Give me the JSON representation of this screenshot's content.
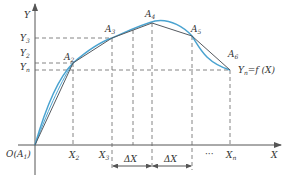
{
  "diagram": {
    "colors": {
      "curve": "#4aa3d0",
      "polyline": "#555a60",
      "axis": "#555555",
      "dashed": "#666666"
    },
    "axes": {
      "x_label": "X",
      "y_label": "Y",
      "origin_label": "O(A",
      "origin_sub": "1",
      "origin_close": ")"
    },
    "points": [
      {
        "name": "A",
        "sub": "2"
      },
      {
        "name": "A",
        "sub": "3"
      },
      {
        "name": "A",
        "sub": "4"
      },
      {
        "name": "A",
        "sub": "5"
      },
      {
        "name": "A",
        "sub": "6"
      }
    ],
    "y_ticks": [
      {
        "name": "Y",
        "sub": "3"
      },
      {
        "name": "Y",
        "sub": "2"
      },
      {
        "name": "Y",
        "sub": "n"
      }
    ],
    "x_ticks": [
      {
        "name": "X",
        "sub": "2"
      },
      {
        "name": "X",
        "sub": "3"
      },
      {
        "name": "X",
        "sub": "n"
      }
    ],
    "ellipsis": "···",
    "delta_labels": [
      "ΔX",
      "ΔX"
    ],
    "function_label": {
      "pre": "Y",
      "sub": "n",
      "post": "=f (X)"
    }
  }
}
